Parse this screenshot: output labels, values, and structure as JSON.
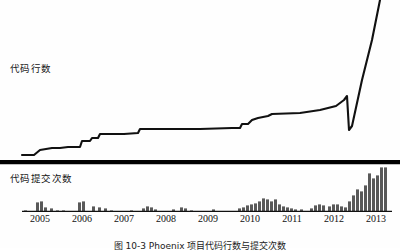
{
  "figure": {
    "caption": "图 10-3  Phoenix 项目代码行数与提交次数",
    "background_color": "#fefefe",
    "line_color": "#111111",
    "bar_color": "#595959",
    "axis_color": "#111111",
    "divider_color": "#000000"
  },
  "panels": {
    "top": {
      "label": "代码行数",
      "label_icon": "line-chart-icon"
    },
    "bottom": {
      "label": "代码提交次数",
      "label_icon": "bar-chart-icon"
    }
  },
  "axis": {
    "years": [
      "2005",
      "2006",
      "2007",
      "2008",
      "2009",
      "2010",
      "2011",
      "2012",
      "2013"
    ],
    "year_x": [
      40,
      82,
      124,
      166,
      208,
      250,
      292,
      334,
      376
    ],
    "baseline_y": 211,
    "start_x": 22,
    "end_x": 392
  },
  "chart_data": [
    {
      "type": "line",
      "title": "代码行数",
      "xlabel": "",
      "ylabel": "代码行数",
      "x": [
        "2005",
        "2006",
        "2007",
        "2008",
        "2009",
        "2010",
        "2011",
        "2012",
        "2013"
      ],
      "xlim": [
        2004.6,
        2013.4
      ],
      "ylim": [
        0,
        100
      ],
      "grid": false,
      "legend": "none",
      "annotations": [
        "line exits top of frame at far right"
      ],
      "points": [
        {
          "x": 22,
          "y": 155
        },
        {
          "x": 34,
          "y": 155
        },
        {
          "x": 40,
          "y": 150
        },
        {
          "x": 52,
          "y": 148
        },
        {
          "x": 60,
          "y": 148
        },
        {
          "x": 68,
          "y": 147
        },
        {
          "x": 80,
          "y": 147
        },
        {
          "x": 82,
          "y": 141
        },
        {
          "x": 90,
          "y": 141
        },
        {
          "x": 92,
          "y": 138
        },
        {
          "x": 98,
          "y": 138
        },
        {
          "x": 100,
          "y": 134
        },
        {
          "x": 124,
          "y": 134
        },
        {
          "x": 138,
          "y": 133
        },
        {
          "x": 140,
          "y": 129
        },
        {
          "x": 166,
          "y": 129
        },
        {
          "x": 200,
          "y": 129
        },
        {
          "x": 232,
          "y": 128
        },
        {
          "x": 240,
          "y": 128
        },
        {
          "x": 242,
          "y": 124
        },
        {
          "x": 248,
          "y": 124
        },
        {
          "x": 252,
          "y": 120
        },
        {
          "x": 258,
          "y": 118
        },
        {
          "x": 268,
          "y": 116
        },
        {
          "x": 272,
          "y": 114
        },
        {
          "x": 300,
          "y": 113
        },
        {
          "x": 320,
          "y": 110
        },
        {
          "x": 336,
          "y": 106
        },
        {
          "x": 344,
          "y": 100
        },
        {
          "x": 347,
          "y": 96
        },
        {
          "x": 349,
          "y": 130
        },
        {
          "x": 352,
          "y": 126
        },
        {
          "x": 362,
          "y": 80
        },
        {
          "x": 372,
          "y": 40
        },
        {
          "x": 380,
          "y": 0
        }
      ]
    },
    {
      "type": "bar",
      "title": "代码提交次数",
      "xlabel": "",
      "ylabel": "代码提交次数",
      "categories": [
        "2005",
        "2006",
        "2007",
        "2008",
        "2009",
        "2010",
        "2011",
        "2012",
        "2013"
      ],
      "ylim": [
        0,
        46
      ],
      "grid": false,
      "legend": "none",
      "bars": [
        {
          "x": 24,
          "w": 3,
          "h": 1
        },
        {
          "x": 36,
          "w": 3,
          "h": 9
        },
        {
          "x": 40,
          "w": 3,
          "h": 10
        },
        {
          "x": 44,
          "w": 3,
          "h": 4
        },
        {
          "x": 50,
          "w": 3,
          "h": 3
        },
        {
          "x": 56,
          "w": 3,
          "h": 1
        },
        {
          "x": 62,
          "w": 3,
          "h": 1
        },
        {
          "x": 78,
          "w": 3,
          "h": 9
        },
        {
          "x": 82,
          "w": 3,
          "h": 10
        },
        {
          "x": 92,
          "w": 3,
          "h": 5
        },
        {
          "x": 98,
          "w": 3,
          "h": 4
        },
        {
          "x": 104,
          "w": 3,
          "h": 3
        },
        {
          "x": 110,
          "w": 3,
          "h": 1
        },
        {
          "x": 130,
          "w": 3,
          "h": 1
        },
        {
          "x": 142,
          "w": 3,
          "h": 3
        },
        {
          "x": 146,
          "w": 3,
          "h": 5
        },
        {
          "x": 150,
          "w": 3,
          "h": 4
        },
        {
          "x": 154,
          "w": 3,
          "h": 2
        },
        {
          "x": 172,
          "w": 3,
          "h": 2
        },
        {
          "x": 180,
          "w": 3,
          "h": 4
        },
        {
          "x": 184,
          "w": 3,
          "h": 3
        },
        {
          "x": 190,
          "w": 3,
          "h": 1
        },
        {
          "x": 212,
          "w": 3,
          "h": 2
        },
        {
          "x": 238,
          "w": 3,
          "h": 3
        },
        {
          "x": 242,
          "w": 3,
          "h": 4
        },
        {
          "x": 246,
          "w": 3,
          "h": 6
        },
        {
          "x": 250,
          "w": 3,
          "h": 7
        },
        {
          "x": 254,
          "w": 3,
          "h": 8
        },
        {
          "x": 258,
          "w": 3,
          "h": 10
        },
        {
          "x": 262,
          "w": 3,
          "h": 13
        },
        {
          "x": 266,
          "w": 3,
          "h": 12
        },
        {
          "x": 270,
          "w": 3,
          "h": 10
        },
        {
          "x": 274,
          "w": 3,
          "h": 12
        },
        {
          "x": 278,
          "w": 3,
          "h": 7
        },
        {
          "x": 282,
          "w": 3,
          "h": 5
        },
        {
          "x": 286,
          "w": 3,
          "h": 4
        },
        {
          "x": 290,
          "w": 3,
          "h": 3
        },
        {
          "x": 294,
          "w": 3,
          "h": 2
        },
        {
          "x": 300,
          "w": 3,
          "h": 2
        },
        {
          "x": 310,
          "w": 3,
          "h": 3
        },
        {
          "x": 314,
          "w": 3,
          "h": 6
        },
        {
          "x": 318,
          "w": 3,
          "h": 7
        },
        {
          "x": 322,
          "w": 3,
          "h": 6
        },
        {
          "x": 328,
          "w": 3,
          "h": 5
        },
        {
          "x": 332,
          "w": 3,
          "h": 7
        },
        {
          "x": 336,
          "w": 3,
          "h": 7
        },
        {
          "x": 340,
          "w": 3,
          "h": 5
        },
        {
          "x": 344,
          "w": 3,
          "h": 4
        },
        {
          "x": 348,
          "w": 3,
          "h": 10
        },
        {
          "x": 352,
          "w": 3,
          "h": 16
        },
        {
          "x": 356,
          "w": 3,
          "h": 22
        },
        {
          "x": 360,
          "w": 3,
          "h": 20
        },
        {
          "x": 364,
          "w": 3,
          "h": 26
        },
        {
          "x": 368,
          "w": 3,
          "h": 38
        },
        {
          "x": 372,
          "w": 3,
          "h": 33
        },
        {
          "x": 376,
          "w": 3,
          "h": 36
        },
        {
          "x": 380,
          "w": 3,
          "h": 44
        },
        {
          "x": 384,
          "w": 3,
          "h": 44
        }
      ]
    }
  ]
}
